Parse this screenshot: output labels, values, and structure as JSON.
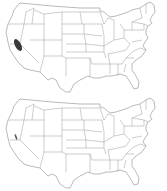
{
  "figure": {
    "panels": [
      {
        "id": "top",
        "description": "US state outline map with highlighted region in central California",
        "highlight": {
          "region": "central-california-valley",
          "color": "#3a3a3a",
          "size": "large"
        }
      },
      {
        "id": "bottom",
        "description": "US state outline map with small highlighted stripe in central California",
        "highlight": {
          "region": "central-california-valley",
          "color": "#5a5a5a",
          "size": "small"
        }
      }
    ],
    "colors": {
      "background": "#ffffff",
      "state_border": "#9a9a9a",
      "highlight_top": "#3a3a3a",
      "highlight_bottom": "#5a5a5a"
    }
  }
}
